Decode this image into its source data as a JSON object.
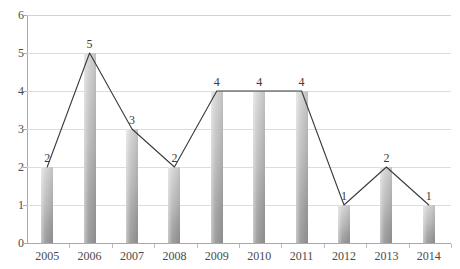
{
  "chart_data": {
    "type": "bar",
    "title": "",
    "xlabel": "",
    "ylabel": "",
    "categories": [
      "2005",
      "2006",
      "2007",
      "2008",
      "2009",
      "2010",
      "2011",
      "2012",
      "2013",
      "2014"
    ],
    "values": [
      2,
      5,
      3,
      2,
      4,
      4,
      4,
      1,
      2,
      1
    ],
    "series": [
      {
        "name": "bars",
        "type": "bar",
        "values": [
          2,
          5,
          3,
          2,
          4,
          4,
          4,
          1,
          2,
          1
        ]
      },
      {
        "name": "trend-line",
        "type": "line",
        "values": [
          2,
          5,
          3,
          2,
          4,
          4,
          4,
          1,
          2,
          1
        ]
      }
    ],
    "data_labels": [
      "2",
      "5",
      "3",
      "2",
      "4",
      "4",
      "4",
      "1",
      "2",
      "1"
    ],
    "ylim": [
      0,
      6
    ],
    "ytick_labels": [
      "0",
      "1",
      "2",
      "3",
      "4",
      "5",
      "6"
    ],
    "ytick_values": [
      0,
      1,
      2,
      3,
      4,
      5,
      6
    ],
    "grid": true,
    "grid_axis": "y",
    "legend": false,
    "legend_position": "none",
    "colors": {
      "bar_light": "#d7d7d7",
      "bar_dark": "#9a9a9a",
      "line": "#3a3a3a",
      "gridline": "#dcdcdc",
      "axis": "#a9a9a9",
      "text": "#4a4a4a",
      "background": "#ffffff"
    }
  },
  "title_remnant": "",
  "axis": {
    "y_labels": [
      "6",
      "5",
      "4",
      "3",
      "2",
      "1",
      "0"
    ],
    "x_labels": [
      "2005",
      "2006",
      "2007",
      "2008",
      "2009",
      "2010",
      "2011",
      "2012",
      "2013",
      "2014"
    ]
  }
}
